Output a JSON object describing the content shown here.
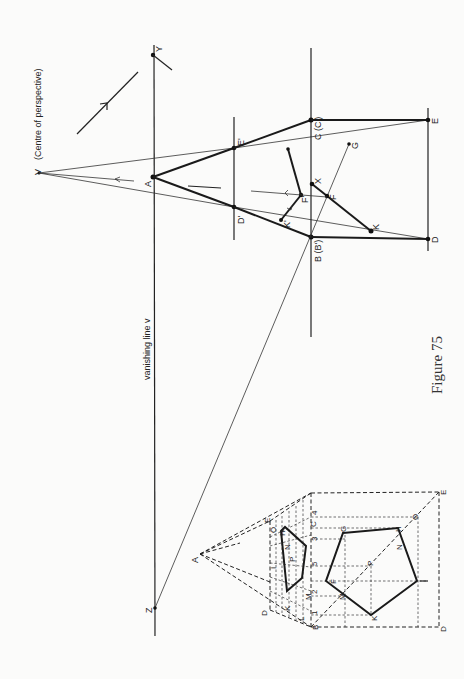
{
  "figure": {
    "caption": "Figure 75",
    "vanishing_line_label": "vanishing line v",
    "centre_label": "(Centre of perspective)"
  },
  "main_points": {
    "V": "V",
    "Y": "Y",
    "A": "A",
    "Z": "Z",
    "C": "C (C')",
    "B": "B (B')",
    "E_prime": "E'",
    "D_prime": "D'",
    "E": "E",
    "D": "D",
    "F_prime": "F'",
    "F": "F",
    "X": "X",
    "K": "K",
    "K_prime": "K'",
    "G": "G"
  },
  "inset_points": {
    "A": "A",
    "B": "B",
    "C": "C",
    "D_small": "D",
    "E_small": "E",
    "D_big": "D",
    "E_big": "E",
    "O_small": "O",
    "H_small": "H",
    "I_small": "I",
    "N_small": "N",
    "P_small": "P",
    "K_small": "K",
    "M_small": "M",
    "L_small": "L",
    "F": "F",
    "G": "G",
    "H": "H",
    "N": "N",
    "I": "I",
    "O": "O",
    "P": "P",
    "M": "M",
    "K": "K",
    "tick_1": "1",
    "tick_2": "2",
    "tick_3": "3",
    "tick_4": "4",
    "tick_5": "5"
  }
}
